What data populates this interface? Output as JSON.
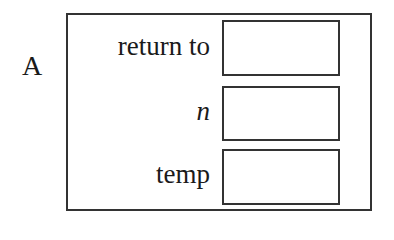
{
  "frame": {
    "label": "A",
    "rows": [
      {
        "label": "return to",
        "italic": false,
        "value": ""
      },
      {
        "label": "n",
        "italic": true,
        "value": ""
      },
      {
        "label": "temp",
        "italic": false,
        "value": ""
      }
    ]
  }
}
